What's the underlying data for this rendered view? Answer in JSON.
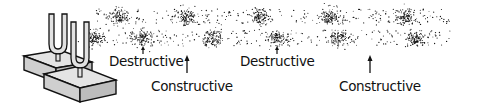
{
  "figure": {
    "colors": {
      "ink": "#111111",
      "block_fill": "#d6d6d6",
      "block_side": "#bdbdbd",
      "fork_fill": "#e2e2e2",
      "background": "#ffffff"
    },
    "bands": [
      {
        "id": "upper-wave",
        "y_center": 17,
        "x_start": 95,
        "x_end": 450,
        "clusters_x": [
          118,
          186,
          258,
          330,
          405
        ]
      },
      {
        "id": "lower-wave",
        "y_center": 38,
        "x_start": 88,
        "x_end": 450,
        "clusters_x": [
          95,
          143,
          213,
          277,
          340,
          416
        ]
      }
    ],
    "labels": [
      {
        "id": "destructive-1",
        "text": "Destructive",
        "x": 109,
        "y": 55,
        "arrow_x": 143,
        "arrow_type": "short"
      },
      {
        "id": "constructive-1",
        "text": "Constructive",
        "x": 151,
        "y": 80,
        "arrow_x": 187,
        "arrow_type": "long"
      },
      {
        "id": "destructive-2",
        "text": "Destructive",
        "x": 240,
        "y": 55,
        "arrow_x": 277,
        "arrow_type": "short"
      },
      {
        "id": "constructive-2",
        "text": "Constructive",
        "x": 339,
        "y": 80,
        "arrow_x": 370,
        "arrow_type": "long"
      }
    ]
  }
}
